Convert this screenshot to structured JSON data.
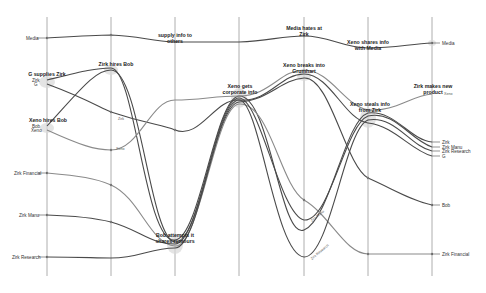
{
  "diagram": {
    "type": "storyline",
    "time_slices_x": [
      47,
      111,
      175,
      239,
      304,
      368,
      432
    ],
    "events": [
      {
        "id": "e1",
        "label": "G supplies Zirk",
        "x": 47,
        "y": 76
      },
      {
        "id": "e2",
        "label": "Zirk hires Bob",
        "x": 111,
        "y": 66
      },
      {
        "id": "e3",
        "label_line1": "supply info to",
        "label_line2": "others",
        "x": 175,
        "y": 38
      },
      {
        "id": "e4",
        "label_line1": "Media hates at",
        "label_line2": "Zirk",
        "x": 304,
        "y": 33
      },
      {
        "id": "e5",
        "label_line1": "Xeno shares info",
        "label_line2": "with Media",
        "x": 368,
        "y": 45
      },
      {
        "id": "e6",
        "label": "Xeno hires Bob",
        "x": 47,
        "y": 122
      },
      {
        "id": "e7",
        "label_line1": "Xeno gets",
        "label_line2": "corporate info",
        "x": 239,
        "y": 92
      },
      {
        "id": "e8",
        "label_line1": "Xeno breaks into",
        "label_line2": "Grumhart",
        "x": 304,
        "y": 70
      },
      {
        "id": "e9",
        "label_line1": "Xeno steals info",
        "label_line2": "from Zirk",
        "x": 368,
        "y": 108
      },
      {
        "id": "e10",
        "label_line1": "Zirk makes new",
        "label_line2": "product",
        "x": 432,
        "y": 90
      },
      {
        "id": "e11",
        "label_line1": "Bob attempts it",
        "label_line2": "shares rumours",
        "x": 175,
        "y": 238
      }
    ],
    "characters_start": [
      {
        "label": "Media",
        "y": 38
      },
      {
        "label": "Zirk",
        "y": 80
      },
      {
        "label": "G",
        "y": 84
      },
      {
        "label": "Bob",
        "y": 126
      },
      {
        "label": "Xeno",
        "y": 130
      },
      {
        "label": "Zirk Financial",
        "y": 173
      },
      {
        "label": "Zirk Manu",
        "y": 215
      },
      {
        "label": "Zirk Research",
        "y": 257
      }
    ],
    "characters_end": [
      {
        "label": "Media",
        "y": 43
      },
      {
        "label": "Xeno",
        "y": 94
      },
      {
        "label": "Zirk",
        "y": 142
      },
      {
        "label": "Zirk Manu",
        "y": 147
      },
      {
        "label": "Zirk Research",
        "y": 151
      },
      {
        "label": "G",
        "y": 156
      },
      {
        "label": "Bob",
        "y": 205
      },
      {
        "label": "Zirk Financial",
        "y": 254
      }
    ],
    "inline_labels": [
      {
        "label": "Zirk",
        "x": 118,
        "y": 120
      },
      {
        "label": "Xeno",
        "x": 117,
        "y": 150
      },
      {
        "label": "Zirk Manu",
        "x": 318,
        "y": 218
      },
      {
        "label": "Zirk Research",
        "x": 320,
        "y": 255
      }
    ],
    "colors": {
      "line": "#4a4a4a",
      "line_light": "#8a8a8a",
      "grid": "#9a9a9a",
      "background": "#ffffff"
    }
  }
}
